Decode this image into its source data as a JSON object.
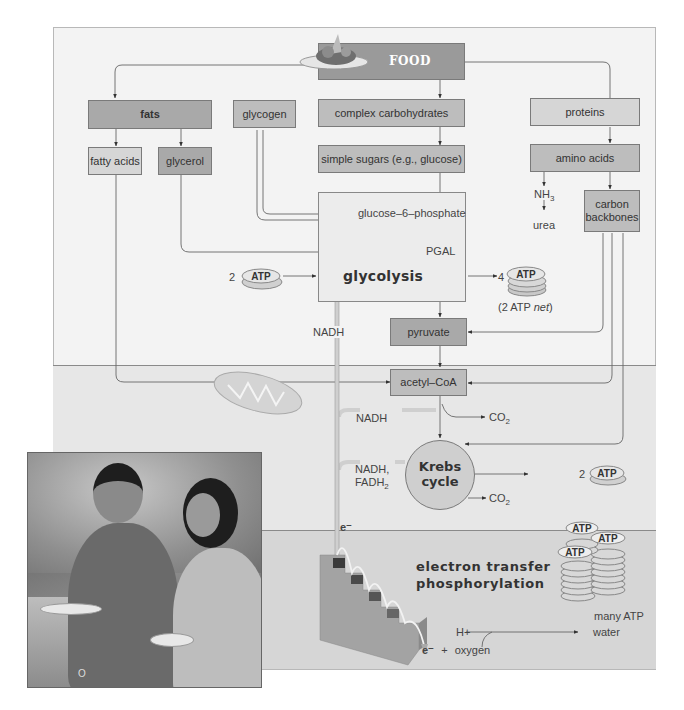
{
  "nodes": {
    "food": "FOOD",
    "fats": "fats",
    "glycogen": "glycogen",
    "complex_carbs": "complex carbohydrates",
    "proteins": "proteins",
    "fatty_acids": "fatty acids",
    "glycerol": "glycerol",
    "simple_sugars": "simple sugars (e.g., glucose)",
    "amino_acids": "amino acids",
    "carbon_backbones_1": "carbon",
    "carbon_backbones_2": "backbones",
    "nh3": "NH",
    "nh3_sub": "3",
    "urea": "urea",
    "g6p": "glucose–6–phosphate",
    "pgal": "PGAL",
    "glycolysis": "glycolysis",
    "pyruvate": "pyruvate",
    "acetyl_coa": "acetyl–CoA",
    "krebs_1": "Krebs",
    "krebs_2": "cycle",
    "etp_1": "electron transfer",
    "etp_2": "phosphorylation"
  },
  "labels": {
    "atp_in_count": "2",
    "atp_out_count": "4",
    "atp_net": "(2 ATP ",
    "atp_net_italic": "net",
    "atp_net_close": ")",
    "nadh_glycolysis": "NADH",
    "nadh_acetyl": "NADH",
    "co2_acetyl": "CO",
    "co2_sub": "2",
    "nadh_krebs": "NADH,",
    "fadh2_krebs": "FADH",
    "fadh2_sub": "2",
    "co2_krebs": "CO",
    "atp_krebs_count": "2",
    "electron": "e⁻",
    "many_atp": "many ATP",
    "h_plus": "H+",
    "water": "water",
    "e_oxygen_e": "e⁻",
    "e_oxygen_plus": "+",
    "e_oxygen": "oxygen",
    "atp": "ATP",
    "photo_caption": "O"
  },
  "colors": {
    "panel_top": "#f3f3f3",
    "panel_mid": "#e7e7e7",
    "panel_bot": "#d6d6d6",
    "box_dark": "#a9a9a9",
    "box_mid": "#bdbdbd",
    "box_light": "#d6d6d6",
    "line": "#555555",
    "staircase": "#a8a8a8"
  }
}
